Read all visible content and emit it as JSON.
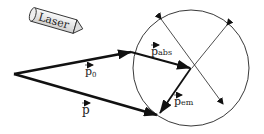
{
  "laser": {
    "label": "Laser"
  },
  "vectors": {
    "p0": {
      "symbol": "p",
      "sub": "0"
    },
    "p": {
      "symbol": "p",
      "sub": ""
    },
    "pabs": {
      "symbol": "p",
      "sub": "abs"
    },
    "pem": {
      "symbol": "p",
      "sub": "em"
    }
  },
  "colors": {
    "stroke": "#111111",
    "laser_fill": "#e8e8e8"
  }
}
